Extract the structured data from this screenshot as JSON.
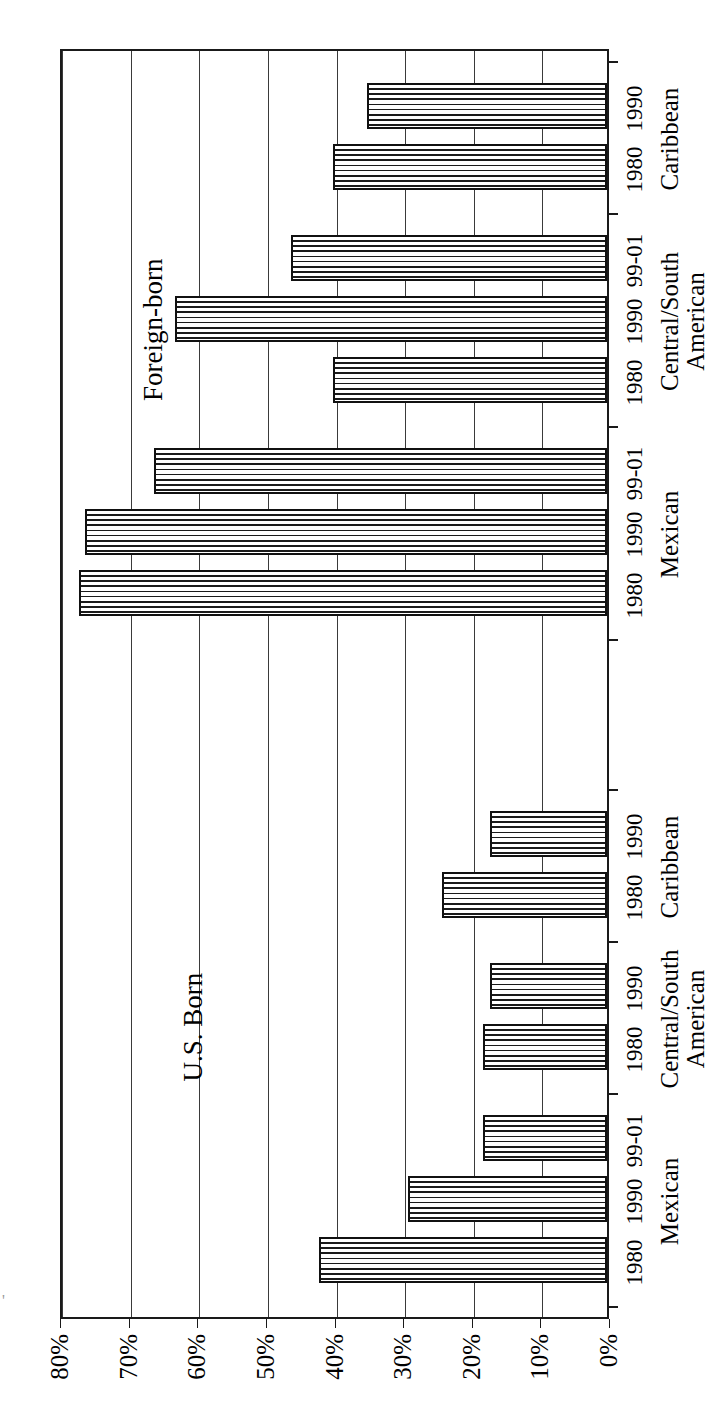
{
  "figure": {
    "section_captions": [
      {
        "label": "U.S. Born"
      },
      {
        "label": "Foreign-born"
      }
    ]
  },
  "chart_data": {
    "type": "bar",
    "orientation": "horizontal-rotated",
    "title": "",
    "subtitle": "",
    "xlabel": "",
    "ylabel": "",
    "ylim": [
      0,
      80
    ],
    "grid": true,
    "legend_position": "none",
    "tick_labels": [
      "0%",
      "10%",
      "20%",
      "30%",
      "40%",
      "50%",
      "60%",
      "70%",
      "80%"
    ],
    "tick_values": [
      0,
      10,
      20,
      30,
      40,
      50,
      60,
      70,
      80
    ],
    "sections": [
      {
        "name": "U.S. Born",
        "groups": [
          {
            "name": "Mexican",
            "bars": [
              {
                "period": "1980",
                "value": 42
              },
              {
                "period": "1990",
                "value": 29
              },
              {
                "period": "99-01",
                "value": 18
              }
            ]
          },
          {
            "name": "Central/South American",
            "name_line1": "Central/South",
            "name_line2": "American",
            "bars": [
              {
                "period": "1980",
                "value": 18
              },
              {
                "period": "1990",
                "value": 17
              }
            ]
          },
          {
            "name": "Caribbean",
            "bars": [
              {
                "period": "1980",
                "value": 24
              },
              {
                "period": "1990",
                "value": 17
              }
            ]
          }
        ]
      },
      {
        "name": "Foreign-born",
        "groups": [
          {
            "name": "Mexican",
            "bars": [
              {
                "period": "1980",
                "value": 77
              },
              {
                "period": "1990",
                "value": 76
              },
              {
                "period": "99-01",
                "value": 66
              }
            ]
          },
          {
            "name": "Central/South American",
            "name_line1": "Central/South",
            "name_line2": "American",
            "bars": [
              {
                "period": "1980",
                "value": 40
              },
              {
                "period": "1990",
                "value": 63
              },
              {
                "period": "99-01",
                "value": 46
              }
            ]
          },
          {
            "name": "Caribbean",
            "bars": [
              {
                "period": "1980",
                "value": 40
              },
              {
                "period": "1990",
                "value": 35
              }
            ]
          }
        ]
      }
    ],
    "flat_bars": [
      {
        "section": "U.S. Born",
        "group": "Mexican",
        "period": "1980",
        "value": 42
      },
      {
        "section": "U.S. Born",
        "group": "Mexican",
        "period": "1990",
        "value": 29
      },
      {
        "section": "U.S. Born",
        "group": "Mexican",
        "period": "99-01",
        "value": 18
      },
      {
        "section": "U.S. Born",
        "group": "Central/South American",
        "period": "1980",
        "value": 18
      },
      {
        "section": "U.S. Born",
        "group": "Central/South American",
        "period": "1990",
        "value": 17
      },
      {
        "section": "U.S. Born",
        "group": "Caribbean",
        "period": "1980",
        "value": 24
      },
      {
        "section": "U.S. Born",
        "group": "Caribbean",
        "period": "1990",
        "value": 17
      },
      {
        "section": "Foreign-born",
        "group": "Mexican",
        "period": "1980",
        "value": 77
      },
      {
        "section": "Foreign-born",
        "group": "Mexican",
        "period": "1990",
        "value": 76
      },
      {
        "section": "Foreign-born",
        "group": "Mexican",
        "period": "99-01",
        "value": 66
      },
      {
        "section": "Foreign-born",
        "group": "Central/South American",
        "period": "1980",
        "value": 40
      },
      {
        "section": "Foreign-born",
        "group": "Central/South American",
        "period": "1990",
        "value": 63
      },
      {
        "section": "Foreign-born",
        "group": "Central/South American",
        "period": "99-01",
        "value": 46
      },
      {
        "section": "Foreign-born",
        "group": "Caribbean",
        "period": "1980",
        "value": 40
      },
      {
        "section": "Foreign-born",
        "group": "Caribbean",
        "period": "1990",
        "value": 35
      }
    ],
    "colors": {
      "bar_fill": "#ffffff",
      "bar_hatch": "#1a1a1a",
      "bar_outline": "#111111",
      "grid": "#3a3a3a",
      "axis": "#1a1a1a",
      "background": "#ffffff"
    }
  }
}
